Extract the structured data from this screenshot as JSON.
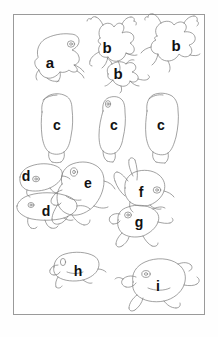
{
  "figure": {
    "kind": "specimen-outline-plate",
    "background_color": "#ffffff",
    "frame_color": "#9a9a9a",
    "outline_color": "#7a7a7a",
    "label_color": "#111111",
    "frame": {
      "x": 13,
      "y": 14,
      "width": 192,
      "height": 301
    }
  },
  "labels": [
    {
      "id": "label-a",
      "text": "a",
      "x": 50,
      "y": 62,
      "size": 15
    },
    {
      "id": "label-b1",
      "text": "b",
      "x": 107,
      "y": 47,
      "size": 15
    },
    {
      "id": "label-b2",
      "text": "b",
      "x": 176,
      "y": 45,
      "size": 15
    },
    {
      "id": "label-b3",
      "text": "b",
      "x": 118,
      "y": 73,
      "size": 15
    },
    {
      "id": "label-c1",
      "text": "c",
      "x": 57,
      "y": 125,
      "size": 14
    },
    {
      "id": "label-c2",
      "text": "c",
      "x": 114,
      "y": 125,
      "size": 14
    },
    {
      "id": "label-c3",
      "text": "c",
      "x": 161,
      "y": 125,
      "size": 14
    },
    {
      "id": "label-d1",
      "text": "d",
      "x": 26,
      "y": 176,
      "size": 14
    },
    {
      "id": "label-e",
      "text": "e",
      "x": 88,
      "y": 183,
      "size": 14
    },
    {
      "id": "label-f",
      "text": "f",
      "x": 141,
      "y": 192,
      "size": 14
    },
    {
      "id": "label-d2",
      "text": "d",
      "x": 46,
      "y": 211,
      "size": 14
    },
    {
      "id": "label-g",
      "text": "g",
      "x": 139,
      "y": 222,
      "size": 14
    },
    {
      "id": "label-h",
      "text": "h",
      "x": 78,
      "y": 271,
      "size": 14
    },
    {
      "id": "label-i",
      "text": "i",
      "x": 158,
      "y": 286,
      "size": 14
    }
  ],
  "specimens": [
    {
      "id": "specimen-a",
      "label": "a",
      "name": "frog-outline-a",
      "pose": "dorsal-limbs-tucked"
    },
    {
      "id": "specimen-b1",
      "label": "b",
      "name": "frog-outline-b1",
      "pose": "spread-limbs"
    },
    {
      "id": "specimen-b2",
      "label": "b",
      "name": "frog-outline-b2",
      "pose": "spread-limbs"
    },
    {
      "id": "specimen-b3",
      "label": "b",
      "name": "frog-outline-b3",
      "pose": "spread-limbs"
    },
    {
      "id": "specimen-c1",
      "label": "c",
      "name": "body-outline-c1",
      "pose": "dorsal-torso"
    },
    {
      "id": "specimen-c2",
      "label": "c",
      "name": "body-outline-c2",
      "pose": "dorsal-torso"
    },
    {
      "id": "specimen-c3",
      "label": "c",
      "name": "body-outline-c3",
      "pose": "dorsal-torso"
    },
    {
      "id": "specimen-d1",
      "label": "d",
      "name": "frog-outline-d1",
      "pose": "lateral"
    },
    {
      "id": "specimen-d2",
      "label": "d",
      "name": "frog-outline-d2",
      "pose": "lateral"
    },
    {
      "id": "specimen-e",
      "label": "e",
      "name": "frog-outline-e",
      "pose": "crouching"
    },
    {
      "id": "specimen-f",
      "label": "f",
      "name": "frog-outline-f",
      "pose": "lateral-legs-up"
    },
    {
      "id": "specimen-g",
      "label": "g",
      "name": "frog-outline-g",
      "pose": "dorsal-sprawled"
    },
    {
      "id": "specimen-h",
      "label": "h",
      "name": "frog-outline-h",
      "pose": "lateral"
    },
    {
      "id": "specimen-i",
      "label": "i",
      "name": "frog-outline-i",
      "pose": "dorsal-sprawled"
    }
  ]
}
